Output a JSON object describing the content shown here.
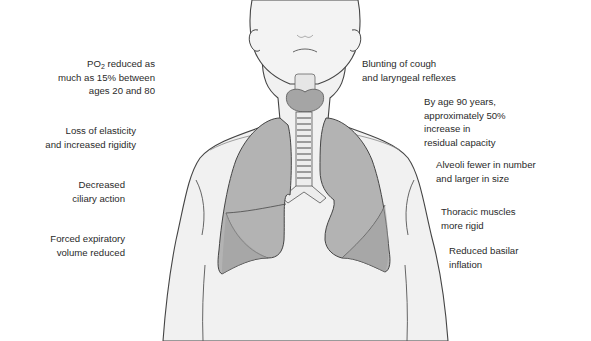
{
  "figure": {
    "colors": {
      "background": "#ffffff",
      "body_fill": "#f1f1f1",
      "outline": "#444444",
      "lung_fill": "#a9a9a9",
      "lung_lower_fill": "#9a9a9a",
      "trachea_ring": "#d9d9d9",
      "thyroid": "#9d9d9d",
      "text": "#2a2a2a"
    },
    "icons": [
      "human-torso-outline",
      "right-lung",
      "left-lung",
      "trachea",
      "thyroid-larynx"
    ]
  },
  "labels_left": [
    {
      "id": "po2",
      "lines": [
        "reduced as",
        "much as 15% between",
        "ages 20 and 80"
      ],
      "prefix": "PO",
      "prefix_sub": "2"
    },
    {
      "id": "elasticity",
      "lines": [
        "Loss of elasticity",
        "and increased rigidity"
      ]
    },
    {
      "id": "ciliary",
      "lines": [
        "Decreased",
        "ciliary action"
      ]
    },
    {
      "id": "fev",
      "lines": [
        "Forced expiratory",
        "volume reduced"
      ]
    }
  ],
  "labels_right": [
    {
      "id": "cough",
      "lines": [
        "Blunting of cough",
        "and laryngeal reflexes"
      ]
    },
    {
      "id": "residual",
      "lines": [
        "By age 90 years,",
        "approximately 50%",
        "increase in",
        "residual capacity"
      ]
    },
    {
      "id": "alveoli",
      "lines": [
        "Alveoli fewer in number",
        "and larger in size"
      ]
    },
    {
      "id": "thoracic",
      "lines": [
        "Thoracic muscles",
        "more rigid"
      ]
    },
    {
      "id": "basilar",
      "lines": [
        "Reduced basilar",
        "inflation"
      ]
    }
  ]
}
